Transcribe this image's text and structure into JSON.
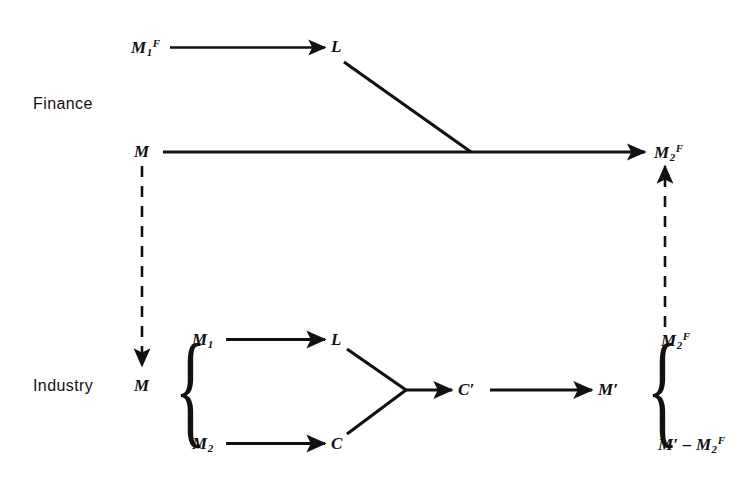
{
  "figure": {
    "type": "diagram",
    "background_color": "#ffffff",
    "ink_color": "#111111"
  },
  "sections": {
    "finance": {
      "label": "Finance"
    },
    "industry": {
      "label": "Industry"
    }
  },
  "nodes": {
    "finance_m1f": {
      "base": "M",
      "sub": "1",
      "sup": "F"
    },
    "finance_l": {
      "base": "L",
      "sub": "",
      "sup": ""
    },
    "finance_m": {
      "base": "M",
      "sub": "",
      "sup": ""
    },
    "finance_m2f": {
      "base": "M",
      "sub": "2",
      "sup": "F"
    },
    "industry_m": {
      "base": "M",
      "sub": "",
      "sup": ""
    },
    "industry_m1": {
      "base": "M",
      "sub": "1",
      "sup": ""
    },
    "industry_m2": {
      "base": "M",
      "sub": "2",
      "sup": ""
    },
    "industry_l": {
      "base": "L",
      "sub": "",
      "sup": ""
    },
    "industry_c": {
      "base": "C",
      "sub": "",
      "sup": ""
    },
    "industry_cprime": {
      "base": "C′",
      "sub": "",
      "sup": ""
    },
    "industry_mprime": {
      "base": "M′",
      "sub": "",
      "sup": ""
    },
    "out_m2f": {
      "base": "M",
      "sub": "2",
      "sup": "F"
    },
    "out_remainder": {
      "base": "M′ – M",
      "sub": "2",
      "sup": "F"
    }
  },
  "braces": {
    "industry_input": "{",
    "industry_output": "{"
  },
  "edges": [
    {
      "name": "m1f-to-l",
      "from": "finance_m1f",
      "to": "finance_l",
      "style": "solid",
      "arrow": true
    },
    {
      "name": "l-to-circuit",
      "from": "finance_l",
      "to": "finance_junction",
      "style": "solid",
      "arrow": false
    },
    {
      "name": "m-to-m2f",
      "from": "finance_m",
      "to": "finance_m2f",
      "style": "solid",
      "arrow": true
    },
    {
      "name": "finance-m-to-industry-m",
      "from": "finance_m",
      "to": "industry_m",
      "style": "dashed",
      "arrow": true
    },
    {
      "name": "industry-m2f-to-finance-m2f",
      "from": "out_m2f",
      "to": "finance_m2f",
      "style": "dashed",
      "arrow": true
    },
    {
      "name": "m1-to-l",
      "from": "industry_m1",
      "to": "industry_l",
      "style": "solid",
      "arrow": true
    },
    {
      "name": "m2-to-c",
      "from": "industry_m2",
      "to": "industry_c",
      "style": "solid",
      "arrow": true
    },
    {
      "name": "l-to-merge",
      "from": "industry_l",
      "to": "merge_point",
      "style": "solid",
      "arrow": false
    },
    {
      "name": "c-to-merge",
      "from": "industry_c",
      "to": "merge_point",
      "style": "solid",
      "arrow": false
    },
    {
      "name": "merge-to-cprime",
      "from": "merge_point",
      "to": "industry_cprime",
      "style": "solid",
      "arrow": true
    },
    {
      "name": "cprime-to-mprime",
      "from": "industry_cprime",
      "to": "industry_mprime",
      "style": "solid",
      "arrow": true
    }
  ]
}
